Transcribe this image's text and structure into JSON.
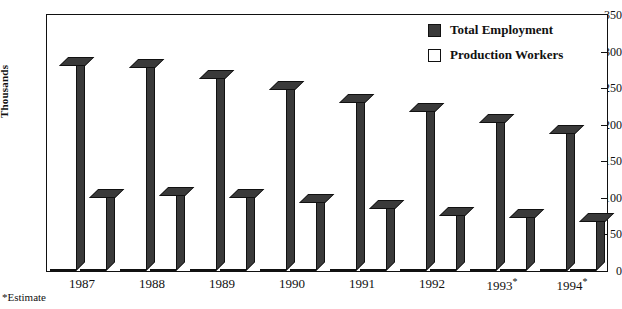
{
  "chart_data": {
    "type": "bar",
    "title": "",
    "xlabel": "",
    "ylabel": "Thousands",
    "ylim": [
      0,
      350
    ],
    "yticks": [
      0,
      50,
      100,
      150,
      200,
      250,
      300,
      350
    ],
    "grid": false,
    "legend_position": "top-right",
    "categories": [
      "1987",
      "1988",
      "1989",
      "1990",
      "1991",
      "1992",
      "1993*",
      "1994*"
    ],
    "series": [
      {
        "name": "Total Employment",
        "color": "#3a3a3a",
        "values": [
          280,
          277,
          263,
          248,
          230,
          218,
          203,
          188
        ]
      },
      {
        "name": "Production Workers",
        "color": "#ffffff",
        "values": [
          100,
          102,
          100,
          93,
          85,
          75,
          72,
          67
        ]
      }
    ],
    "annotations": [
      "*Estimate"
    ]
  },
  "axis": {
    "y_title": "Thousands",
    "y_tick_labels": [
      "350",
      "300",
      "250",
      "200",
      "150",
      "100",
      "50",
      "0"
    ],
    "x_tick_labels": [
      "1987",
      "1988",
      "1989",
      "1990",
      "1991",
      "1992",
      "1993*",
      "1994*"
    ]
  },
  "legend": {
    "items": [
      {
        "label": "Total Employment",
        "swatch": "#3a3a3a"
      },
      {
        "label": "Production Workers",
        "swatch": "#ffffff"
      }
    ]
  },
  "footnote": {
    "text": "*Estimate"
  },
  "colors": {
    "bar_dark": "#3a3a3a",
    "bar_light": "#ffffff",
    "outline": "#111111",
    "background": "#ffffff"
  }
}
